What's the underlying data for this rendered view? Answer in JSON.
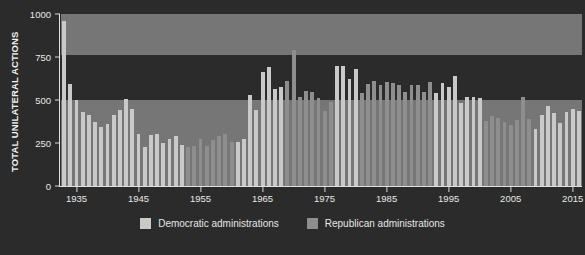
{
  "chart_data": {
    "type": "bar",
    "title": "",
    "xlabel": "",
    "ylabel": "TOTAL UNILATERAL ACTIONS",
    "ylim": [
      0,
      1000
    ],
    "xlim": [
      1932.5,
      2016.5
    ],
    "yticks": [
      0,
      250,
      500,
      750,
      1000
    ],
    "ytick_labels": [
      "0",
      "250",
      "500",
      "750",
      "1000"
    ],
    "xticks": [
      1935,
      1945,
      1955,
      1965,
      1975,
      1985,
      1995,
      2005,
      2015
    ],
    "xtick_labels": [
      "1935",
      "1945",
      "1955",
      "1965",
      "1975",
      "1985",
      "1995",
      "2005",
      "2015"
    ],
    "grid": false,
    "legend_position": "bottom",
    "legend": [
      {
        "key": "dem",
        "label": "Democratic administrations",
        "color": "#c9c9c9"
      },
      {
        "key": "rep",
        "label": "Republican administrations",
        "color": "#8e8e8e"
      }
    ],
    "background_bands": [
      {
        "y0": 760,
        "y1": 1000,
        "color": "#767676"
      },
      {
        "y0": 0,
        "y1": 500,
        "color": "#767676"
      }
    ],
    "x": [
      1933,
      1934,
      1935,
      1936,
      1937,
      1938,
      1939,
      1940,
      1941,
      1942,
      1943,
      1944,
      1945,
      1946,
      1947,
      1948,
      1949,
      1950,
      1951,
      1952,
      1953,
      1954,
      1955,
      1956,
      1957,
      1958,
      1959,
      1960,
      1961,
      1962,
      1963,
      1964,
      1965,
      1966,
      1967,
      1968,
      1969,
      1970,
      1971,
      1972,
      1973,
      1974,
      1975,
      1976,
      1977,
      1978,
      1979,
      1980,
      1981,
      1982,
      1983,
      1984,
      1985,
      1986,
      1987,
      1988,
      1989,
      1990,
      1991,
      1992,
      1993,
      1994,
      1995,
      1996,
      1997,
      1998,
      1999,
      2000,
      2001,
      2002,
      2003,
      2004,
      2005,
      2006,
      2007,
      2008,
      2009,
      2010,
      2011,
      2012,
      2013,
      2014,
      2015,
      2016
    ],
    "values": [
      960,
      595,
      500,
      430,
      415,
      370,
      345,
      360,
      415,
      440,
      505,
      450,
      300,
      225,
      295,
      305,
      250,
      275,
      290,
      240,
      225,
      235,
      275,
      235,
      265,
      290,
      300,
      255,
      255,
      275,
      530,
      440,
      665,
      690,
      565,
      575,
      610,
      790,
      520,
      555,
      545,
      510,
      435,
      490,
      695,
      700,
      620,
      680,
      540,
      595,
      610,
      585,
      605,
      600,
      590,
      545,
      590,
      590,
      545,
      605,
      540,
      600,
      575,
      640,
      480,
      520,
      520,
      510,
      380,
      405,
      395,
      370,
      355,
      385,
      520,
      390,
      330,
      410,
      465,
      425,
      365,
      430,
      450,
      435
    ],
    "party": [
      "dem",
      "dem",
      "dem",
      "dem",
      "dem",
      "dem",
      "dem",
      "dem",
      "dem",
      "dem",
      "dem",
      "dem",
      "dem",
      "dem",
      "dem",
      "dem",
      "dem",
      "dem",
      "dem",
      "dem",
      "rep",
      "rep",
      "rep",
      "rep",
      "rep",
      "rep",
      "rep",
      "rep",
      "dem",
      "dem",
      "dem",
      "dem",
      "dem",
      "dem",
      "dem",
      "dem",
      "rep",
      "rep",
      "rep",
      "rep",
      "rep",
      "rep",
      "rep",
      "rep",
      "dem",
      "dem",
      "dem",
      "dem",
      "rep",
      "rep",
      "rep",
      "rep",
      "rep",
      "rep",
      "rep",
      "rep",
      "rep",
      "rep",
      "rep",
      "rep",
      "dem",
      "dem",
      "dem",
      "dem",
      "dem",
      "dem",
      "dem",
      "dem",
      "rep",
      "rep",
      "rep",
      "rep",
      "rep",
      "rep",
      "rep",
      "rep",
      "dem",
      "dem",
      "dem",
      "dem",
      "dem",
      "dem",
      "dem",
      "dem"
    ]
  }
}
